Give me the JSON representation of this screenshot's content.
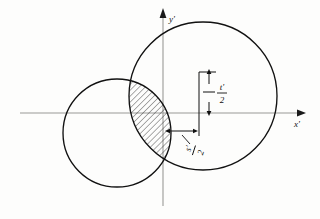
{
  "figure": {
    "background_color": "#fdfdfc",
    "stroke_color": "#111111",
    "axis_color": "#9a9a96",
    "hatch_color": "#222222"
  },
  "axes": {
    "x_axis": {
      "label": "x'",
      "name": "x-prime-axis",
      "origin_x": 163,
      "y": 113,
      "start_x": 20,
      "end_x": 300,
      "arrow": "right"
    },
    "y_axis": {
      "label": "y'",
      "name": "y-prime-axis",
      "x": 163,
      "start_y": 205,
      "end_y": 8,
      "arrow": "up"
    }
  },
  "circles": [
    {
      "name": "left-circle",
      "cx": 117,
      "cy": 133,
      "r": 54
    },
    {
      "name": "right-circle",
      "cx": 203,
      "cy": 96,
      "r": 74
    }
  ],
  "lens": {
    "name": "intersection-lens",
    "fill": "hatched",
    "hatch_angle_deg": 45,
    "hatch_spacing_px": 4
  },
  "dimensions": [
    {
      "name": "t-half-dimension",
      "label_numerator": "t'",
      "label_denominator": "2",
      "orientation": "vertical",
      "extension_top_y": 72,
      "extension_bottom_y": 113,
      "extension_x": 199,
      "arrow_x": 209,
      "label_x": 219,
      "label_y": 90
    },
    {
      "name": "s-half-dimension",
      "label_numerator": "s'",
      "label_denominator": "2",
      "orientation": "horizontal",
      "line_y": 131,
      "start_x": 163,
      "end_x": 199,
      "label_x": 193,
      "label_y": 148,
      "label_rotation_deg": -72
    }
  ],
  "labels": {
    "x_axis_label": "x'",
    "y_axis_label": "y'",
    "t_over_2": "t'/2",
    "s_over_2": "s'/2"
  }
}
